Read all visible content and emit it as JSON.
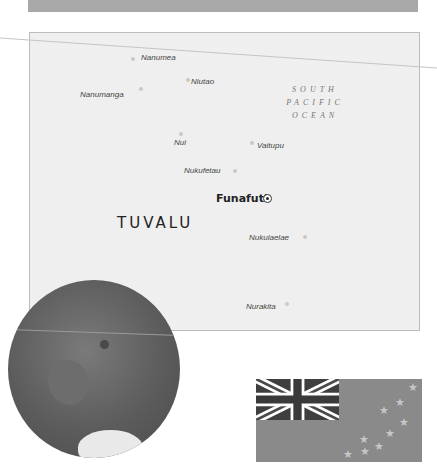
{
  "map": {
    "country": "TUVALU",
    "capital": "Funafuti",
    "ocean_label": [
      "SOUTH",
      "PACIFIC",
      "OCEAN"
    ],
    "islands": [
      {
        "name": "Nanumea",
        "x": 141,
        "y": 53,
        "dot_x": 131,
        "dot_y": 57
      },
      {
        "name": "Niutao",
        "x": 191,
        "y": 77,
        "dot_x": 186,
        "dot_y": 78
      },
      {
        "name": "Nanumanga",
        "x": 80,
        "y": 90,
        "dot_x": 139,
        "dot_y": 87
      },
      {
        "name": "Nui",
        "x": 174,
        "y": 138,
        "dot_x": 179,
        "dot_y": 132
      },
      {
        "name": "Vaitupu",
        "x": 257,
        "y": 141,
        "dot_x": 250,
        "dot_y": 141
      },
      {
        "name": "Nukufetau",
        "x": 184,
        "y": 166,
        "dot_x": 233,
        "dot_y": 169
      },
      {
        "name": "Nukulaelae",
        "x": 249,
        "y": 233,
        "dot_x": 303,
        "dot_y": 235
      },
      {
        "name": "Nurakita",
        "x": 246,
        "y": 302,
        "dot_x": 285,
        "dot_y": 302
      }
    ]
  },
  "colors": {
    "top_bar": "#a9a9a9",
    "map_bg": "#efefef",
    "flag_field": "#8a8a8a",
    "flag_canton": "#3f3f3f"
  },
  "flag": {
    "name": "Flag of Tuvalu",
    "stars": 9
  },
  "globe": {
    "name": "Locator globe"
  }
}
